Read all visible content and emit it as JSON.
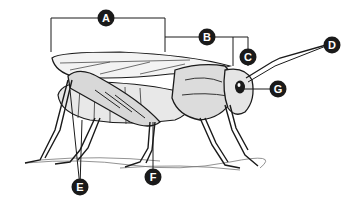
{
  "diagram": {
    "labels": [
      {
        "id": "A",
        "text": "A",
        "x": 106,
        "y": 18,
        "points_to": "wings (forewing span)"
      },
      {
        "id": "B",
        "text": "B",
        "x": 207,
        "y": 37,
        "points_to": "thorax"
      },
      {
        "id": "C",
        "text": "C",
        "x": 248,
        "y": 57,
        "points_to": "head"
      },
      {
        "id": "D",
        "text": "D",
        "x": 332,
        "y": 45,
        "points_to": "antenna"
      },
      {
        "id": "E",
        "text": "E",
        "x": 80,
        "y": 187,
        "points_to": "hind legs"
      },
      {
        "id": "F",
        "text": "F",
        "x": 153,
        "y": 177,
        "points_to": "middle leg"
      },
      {
        "id": "G",
        "text": "G",
        "x": 278,
        "y": 89,
        "points_to": "compound eye"
      }
    ],
    "line_color": "#1a1a1a",
    "label_bg": "#1a1a1a",
    "label_fg": "#ffffff"
  }
}
